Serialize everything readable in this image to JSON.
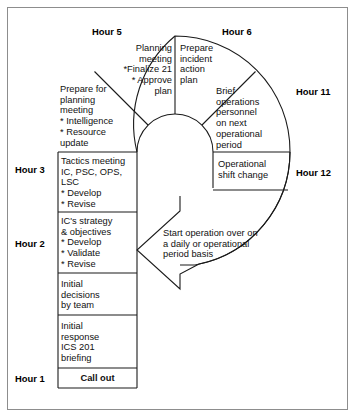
{
  "diagram": {
    "frame_color": "#8d8d8d",
    "line_color": "#1a1a1a",
    "background": "#ffffff"
  },
  "hour_labels": [
    {
      "id": "hour-5",
      "text": "Hour 5"
    },
    {
      "id": "hour-6",
      "text": "Hour 6"
    },
    {
      "id": "hour-11",
      "text": "Hour 11"
    },
    {
      "id": "hour-12",
      "text": "Hour 12"
    },
    {
      "id": "hour-3",
      "text": "Hour 3"
    },
    {
      "id": "hour-2",
      "text": "Hour 2"
    },
    {
      "id": "hour-1",
      "text": "Hour 1"
    }
  ],
  "arc_steps": [
    {
      "id": "prepare-planning-meeting",
      "text": "Prepare for\nplanning\nmeeting\n* Intelligence\n* Resource\n update"
    },
    {
      "id": "planning-meeting",
      "text": "Planning\nmeeting\n*Finalize 21\n* Approve\n plan"
    },
    {
      "id": "prepare-incident-action-plan",
      "text": "Prepare\nincident\naction\nplan"
    },
    {
      "id": "brief-operations-personnel",
      "text": "Brief\noperations\npersonnel\non next\noperational\nperiod"
    }
  ],
  "column_steps": [
    {
      "id": "operational-shift-change",
      "text": "Operational\nshift change"
    },
    {
      "id": "tactics-meeting",
      "text": "Tactics meeting\nIC, PSC, OPS,\nLSC\n* Develop\n* Revise"
    },
    {
      "id": "ic-strategy-objectives",
      "text": "IC's strategy\n& objectives\n* Develop\n* Validate\n* Revise"
    },
    {
      "id": "initial-decisions",
      "text": "Initial\ndecisions\nby team"
    },
    {
      "id": "initial-response",
      "text": "Initial\nresponse\nICS 201\nbriefing"
    },
    {
      "id": "call-out",
      "text": "Call out"
    }
  ],
  "arrow": {
    "id": "restart-arrow",
    "text": "Start operation over on\na daily or operational\nperiod basis"
  }
}
